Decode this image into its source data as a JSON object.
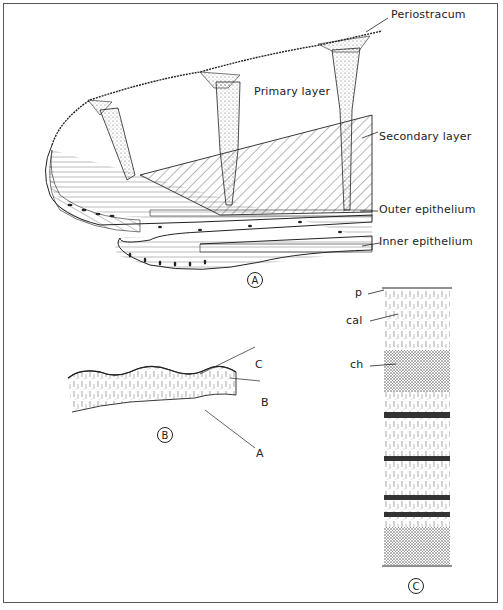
{
  "figure": {
    "panels": [
      {
        "id": "A",
        "badge": "A",
        "labels": {
          "periostracum": "Periostracum",
          "primary_layer": "Primary layer",
          "secondary_layer": "Secondary layer",
          "outer_epithelium": "Outer epithelium",
          "inner_epithelium": "Inner epithelium"
        }
      },
      {
        "id": "B",
        "badge": "B",
        "labels": {
          "c": "C",
          "b": "B",
          "a": "A"
        }
      },
      {
        "id": "C",
        "badge": "C",
        "labels": {
          "p": "p",
          "cal": "cal",
          "ch": "ch"
        }
      }
    ]
  },
  "colors": {
    "ink": "#222222",
    "border": "#555555",
    "background": "#ffffff"
  }
}
